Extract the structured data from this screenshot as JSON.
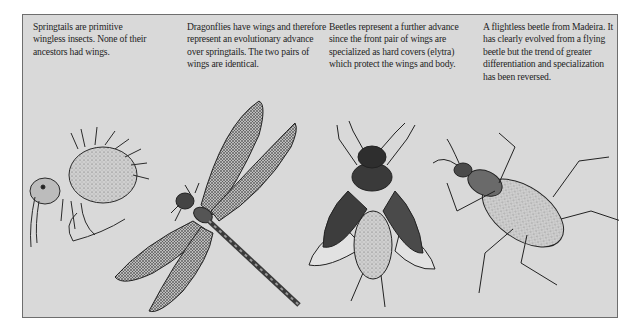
{
  "figure": {
    "captions": [
      {
        "id": "springtails",
        "text": "Springtails are primitive wingless insects. None of their ancestors had wings."
      },
      {
        "id": "dragonflies",
        "text": "Dragonflies have wings and therefore represent an evolutionary advance over springtails. The two pairs of wings are identical."
      },
      {
        "id": "beetles",
        "text": "Beetles represent a further advance since the front pair of wings are specialized as hard covers (elytra) which protect the wings and body."
      },
      {
        "id": "flightless-beetle",
        "text": "A flightless beetle from Madeira. It has clearly evolved from a flying beetle but the trend of greater differentiation and specialization has been reversed."
      }
    ],
    "illustrations": [
      {
        "id": "springtail",
        "icon": "springtail-illustration"
      },
      {
        "id": "dragonfly",
        "icon": "dragonfly-illustration"
      },
      {
        "id": "flying-beetle",
        "icon": "flying-beetle-illustration"
      },
      {
        "id": "ground-beetle",
        "icon": "ground-beetle-illustration"
      }
    ],
    "colors": {
      "panel_bg": "#d9d9d9",
      "border": "#6e6e6e",
      "text": "#1e1e1e",
      "ink": "#2a2a2a"
    }
  }
}
